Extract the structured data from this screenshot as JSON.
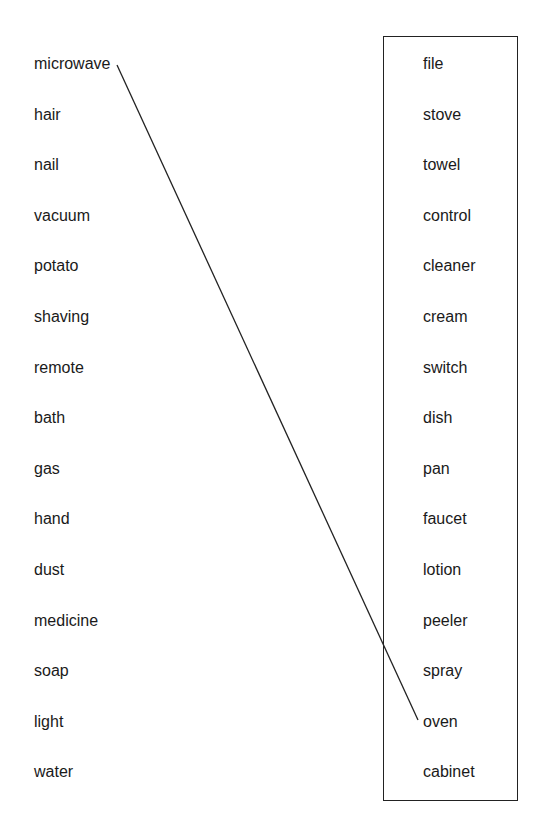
{
  "exercise": {
    "type": "word-matching",
    "left_column": [
      "microwave",
      "hair",
      "nail",
      "vacuum",
      "potato",
      "shaving",
      "remote",
      "bath",
      "gas",
      "hand",
      "dust",
      "medicine",
      "soap",
      "light",
      "water"
    ],
    "right_column": [
      "file",
      "stove",
      "towel",
      "control",
      "cleaner",
      "cream",
      "switch",
      "dish",
      "pan",
      "faucet",
      "lotion",
      "peeler",
      "spray",
      "oven",
      "cabinet"
    ],
    "connections": [
      {
        "from": "microwave",
        "to": "oven"
      }
    ],
    "colors": {
      "text": "#1a1a1a",
      "line": "#222222",
      "box_border": "#222222",
      "background": "#ffffff"
    }
  }
}
